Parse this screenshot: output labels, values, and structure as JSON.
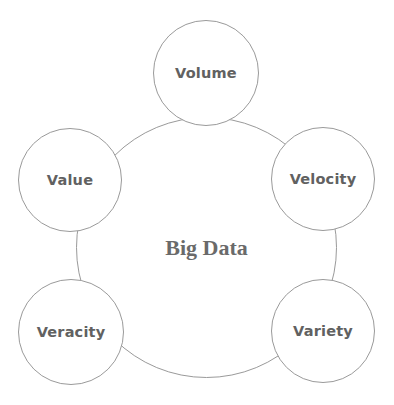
{
  "diagram": {
    "type": "hub-and-spoke",
    "hub": {
      "label": "Big Data",
      "cx": 206,
      "cy": 247,
      "r": 130
    },
    "satellites": [
      {
        "label": "Volume",
        "cx": 206,
        "cy": 73,
        "r": 53
      },
      {
        "label": "Velocity",
        "cx": 323,
        "cy": 179,
        "r": 52
      },
      {
        "label": "Variety",
        "cx": 323,
        "cy": 331,
        "r": 52
      },
      {
        "label": "Veracity",
        "cx": 71,
        "cy": 332,
        "r": 53
      },
      {
        "label": "Value",
        "cx": 70,
        "cy": 180,
        "r": 52
      }
    ],
    "colors": {
      "stroke": "#9a9a9a",
      "text": "#616161",
      "background": "#ffffff"
    }
  }
}
